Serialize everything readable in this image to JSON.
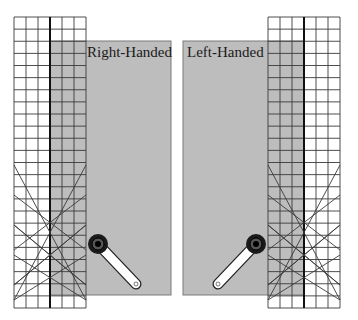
{
  "diagram": {
    "colors": {
      "background": "#ffffff",
      "fabric": "#bdbdbd",
      "fabric_edge": "#7a7a7a",
      "grid_line": "#3a3a3a",
      "ruler_center": "#111111",
      "cutter_body": "#1a1a1a",
      "cutter_handle": "#ffffff"
    },
    "panels": [
      {
        "id": "right-handed",
        "label": "Right-Handed",
        "fabric": {
          "x": 50,
          "y": 41,
          "w": 121,
          "h": 254
        },
        "ruler": {
          "x": 14,
          "y": 17,
          "w": 72,
          "h": 291,
          "cols": 6,
          "rows": 24,
          "center_x": 50
        },
        "cutter": {
          "hub_x": 98,
          "hub_y": 244,
          "tip_x": 136,
          "tip_y": 284
        }
      },
      {
        "id": "left-handed",
        "label": "Left-Handed",
        "fabric": {
          "x": 183,
          "y": 41,
          "w": 121,
          "h": 254
        },
        "ruler": {
          "x": 268,
          "y": 17,
          "w": 72,
          "h": 291,
          "cols": 6,
          "rows": 24,
          "center_x": 304
        },
        "cutter": {
          "hub_x": 256,
          "hub_y": 244,
          "tip_x": 218,
          "tip_y": 284
        }
      }
    ]
  }
}
